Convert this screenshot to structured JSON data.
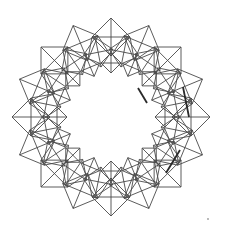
{
  "figure": {
    "type": "geometric-line-drawing",
    "center": [
      111,
      117
    ],
    "symmetry": 16,
    "rings": [
      {
        "name": "outer-diamonds",
        "center_radius": 80,
        "half_size": 19,
        "angle_offset_deg": 0
      },
      {
        "name": "middle-diamonds",
        "center_radius": 66,
        "half_size": 15,
        "angle_offset_deg": 11.25
      },
      {
        "name": "inner-diamonds",
        "center_radius": 54,
        "half_size": 10,
        "angle_offset_deg": 0
      }
    ],
    "stroke_color": "#4a4a4a",
    "heavy_stroke_color": "#2a2a2a",
    "heavy_edges": [
      [
        [
          138,
          88
        ],
        [
          147,
          103
        ]
      ],
      [
        [
          183,
          87
        ],
        [
          189,
          117
        ]
      ],
      [
        [
          180,
          150
        ],
        [
          166,
          173
        ]
      ]
    ],
    "stray_dot": [
      208,
      219
    ],
    "background": "#ffffff"
  }
}
